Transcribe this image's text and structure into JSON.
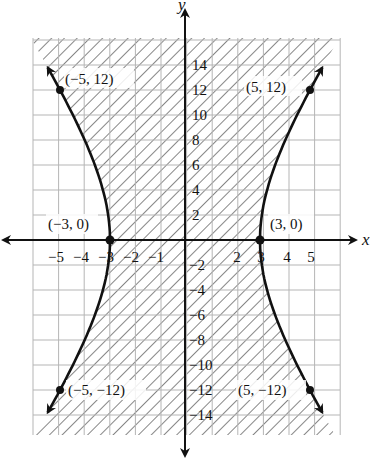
{
  "chart_data": {
    "type": "line",
    "title": "",
    "xlabel": "x",
    "ylabel": "y",
    "equation": "x^2/9 - y^2/81 = 1",
    "inequality_shading": "region between branches shaded (x^2/9 - y^2/81 < 1)",
    "xlim": [
      -6,
      6
    ],
    "ylim": [
      -16,
      16
    ],
    "grid": true,
    "x_ticks": [
      -5,
      -4,
      -3,
      -2,
      -1,
      2,
      3,
      4,
      5
    ],
    "y_ticks": [
      14,
      12,
      10,
      8,
      6,
      4,
      2,
      -2,
      -4,
      -6,
      -8,
      -10,
      -12,
      -14
    ],
    "series": [
      {
        "name": "right branch",
        "x": [
          5.6,
          5,
          4,
          3.5,
          3,
          3.5,
          4,
          5,
          5.6
        ],
        "y": [
          14.1,
          12,
          7.94,
          4.64,
          0,
          -4.64,
          -7.94,
          -12,
          -14.1
        ]
      },
      {
        "name": "left branch",
        "x": [
          -5.6,
          -5,
          -4,
          -3.5,
          -3,
          -3.5,
          -4,
          -5,
          -5.6
        ],
        "y": [
          14.1,
          12,
          7.94,
          4.64,
          0,
          -4.64,
          -7.94,
          -12,
          -14.1
        ]
      }
    ],
    "points": [
      {
        "label": "(-5, 12)",
        "x": -5,
        "y": 12
      },
      {
        "label": "(5, 12)",
        "x": 5,
        "y": 12
      },
      {
        "label": "(-3, 0)",
        "x": -3,
        "y": 0
      },
      {
        "label": "(3, 0)",
        "x": 3,
        "y": 0
      },
      {
        "label": "(-5, -12)",
        "x": -5,
        "y": -12
      },
      {
        "label": "(5, -12)",
        "x": 5,
        "y": -12
      }
    ]
  },
  "axes": {
    "x_label": "x",
    "y_label": "y"
  },
  "ticks": {
    "x": [
      "−5",
      "−4",
      "−3",
      "−2",
      "−1",
      "2",
      "3",
      "4",
      "5"
    ],
    "y_pos": [
      "14",
      "12",
      "10",
      "8",
      "6",
      "4",
      "2"
    ],
    "y_neg": [
      "−2",
      "−4",
      "−6",
      "−8",
      "−10",
      "−12",
      "−14"
    ]
  },
  "point_labels": {
    "p1": "(−5, 12)",
    "p2": "(5, 12)",
    "p3": "(−3, 0)",
    "p4": "(3, 0)",
    "p5": "(−5, −12)",
    "p6": "(5, −12)"
  }
}
